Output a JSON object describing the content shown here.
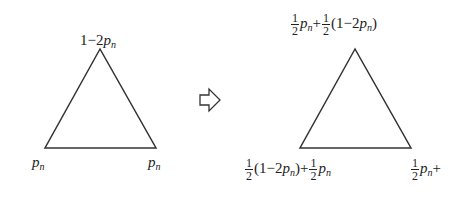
{
  "diagram": {
    "type": "state-transition",
    "left_triangle": {
      "top_vertex": {
        "prefix": "1−2",
        "var": "p",
        "sub": "n"
      },
      "bottom_left_vertex": {
        "var": "p",
        "sub": "n"
      },
      "bottom_right_vertex": {
        "var": "p",
        "sub": "n"
      }
    },
    "arrow": {
      "icon": "hollow-right-arrow",
      "glyph": "⇨"
    },
    "right_triangle": {
      "top_vertex": {
        "frac1_num": "1",
        "frac1_den": "2",
        "var1": "p",
        "sub1": "n",
        "op": "+",
        "frac2_num": "1",
        "frac2_den": "2",
        "paren": "(1−2",
        "var2": "p",
        "sub2": "n",
        "close": ")"
      },
      "bottom_left_vertex": {
        "frac1_num": "1",
        "frac1_den": "2",
        "paren": "(1−2",
        "var1": "p",
        "sub1": "n",
        "close": ")",
        "op": "+",
        "frac2_num": "1",
        "frac2_den": "2",
        "var2": "p",
        "sub2": "n"
      },
      "bottom_right_vertex": {
        "frac1_num": "1",
        "frac1_den": "2",
        "var1": "p",
        "sub1": "n",
        "op": "+",
        "trail": "·"
      }
    },
    "stroke_color": "#333333"
  }
}
